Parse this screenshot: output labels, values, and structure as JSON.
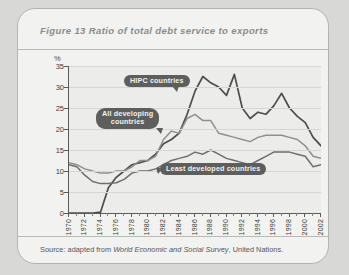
{
  "figure": {
    "title": "Figure 13  Ratio of total debt service to exports",
    "source_prefix": "Source: adapted from ",
    "source_italic": "World Economic and Social Survey",
    "source_suffix": ", United Nations."
  },
  "annotations": {
    "hipc": "HIPC countries",
    "all_developing": "All developing\ncountries",
    "least_developed": "Least developed countries"
  },
  "colors": {
    "card_background": "#f2f2f0",
    "plot_background": "#ececeb",
    "axis": "#5a5a58",
    "gridline": "#d6d6d4",
    "callout": "#5e5e5c",
    "hipc_line": "#4d4d4b",
    "all_developing_line": "#8f8f8d",
    "least_developed_line": "#6e6e6c",
    "title_text": "#8c8c8a"
  },
  "chart_data": {
    "type": "line",
    "title": "Ratio of total debt service to exports",
    "xlabel": "",
    "ylabel": "%",
    "ylim": [
      0,
      35
    ],
    "ytick_step": 5,
    "yticks": [
      0,
      5,
      10,
      15,
      20,
      25,
      30,
      35
    ],
    "xlim": [
      1970,
      2002
    ],
    "xtick_step": 2,
    "grid": true,
    "legend": "inline-callouts",
    "x": [
      1970,
      1971,
      1972,
      1973,
      1974,
      1975,
      1976,
      1977,
      1978,
      1979,
      1980,
      1981,
      1982,
      1983,
      1984,
      1985,
      1986,
      1987,
      1988,
      1989,
      1990,
      1991,
      1992,
      1993,
      1994,
      1995,
      1996,
      1997,
      1998,
      1999,
      2000,
      2001,
      2002
    ],
    "series": [
      {
        "name": "HIPC countries",
        "values": [
          0,
          0,
          0,
          0,
          0.2,
          6.0,
          8.5,
          10.0,
          11.5,
          12.0,
          12.5,
          14.0,
          16.5,
          17.5,
          19.0,
          23.5,
          29.0,
          32.5,
          31.0,
          30.0,
          28.0,
          33.0,
          25.0,
          22.5,
          24.0,
          23.5,
          25.5,
          28.5,
          25.0,
          23.0,
          21.5,
          18.0,
          16.0
        ]
      },
      {
        "name": "All developing countries",
        "values": [
          12.0,
          11.5,
          10.5,
          10.0,
          9.5,
          9.5,
          10.0,
          10.0,
          11.0,
          12.5,
          12.5,
          13.5,
          17.5,
          19.5,
          19.0,
          22.5,
          23.5,
          22.0,
          22.0,
          19.0,
          18.5,
          18.0,
          17.5,
          17.0,
          18.0,
          18.5,
          18.5,
          18.5,
          18.0,
          17.5,
          16.0,
          13.5,
          13.0
        ]
      },
      {
        "name": "Least developed countries",
        "values": [
          11.5,
          11.0,
          9.0,
          7.5,
          7.0,
          7.0,
          7.2,
          8.0,
          9.5,
          10.0,
          10.0,
          10.5,
          11.5,
          12.5,
          13.0,
          13.5,
          14.5,
          14.0,
          15.0,
          14.0,
          13.0,
          12.5,
          12.0,
          11.5,
          12.5,
          13.5,
          14.5,
          14.5,
          14.5,
          14.0,
          13.5,
          11.0,
          11.5
        ]
      }
    ]
  }
}
